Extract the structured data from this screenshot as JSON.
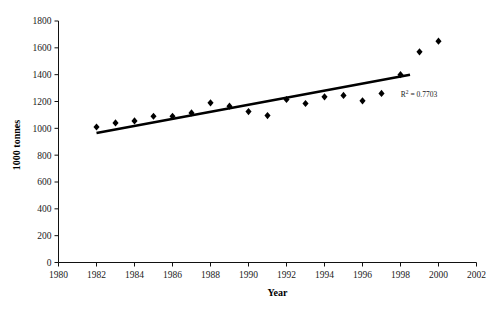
{
  "chart_data": {
    "type": "scatter",
    "title": "",
    "xlabel": "Year",
    "ylabel": "1000 tonnes",
    "xlim": [
      1980,
      2002
    ],
    "ylim": [
      0,
      1800
    ],
    "xticks": [
      1980,
      1982,
      1984,
      1986,
      1988,
      1990,
      1992,
      1994,
      1996,
      1998,
      2000,
      2002
    ],
    "yticks": [
      0,
      200,
      400,
      600,
      800,
      1000,
      1200,
      1400,
      1600,
      1800
    ],
    "xtick_labels": [
      "1980",
      "1982",
      "1984",
      "1986",
      "1988",
      "1990",
      "1992",
      "1994",
      "1996",
      "1998",
      "2000",
      "2002"
    ],
    "ytick_labels": [
      "0",
      "200",
      "400",
      "600",
      "800",
      "1000",
      "1200",
      "1400",
      "1600",
      "1800"
    ],
    "grid": false,
    "legend": false,
    "marker": "diamond",
    "marker_color": "#000000",
    "x": [
      1982,
      1983,
      1984,
      1985,
      1986,
      1987,
      1988,
      1989,
      1990,
      1991,
      1992,
      1993,
      1994,
      1995,
      1996,
      1997,
      1998,
      1999,
      2000
    ],
    "values": [
      1010,
      1040,
      1055,
      1090,
      1090,
      1115,
      1190,
      1165,
      1125,
      1095,
      1215,
      1185,
      1235,
      1245,
      1205,
      1260,
      1400,
      1570,
      1650
    ],
    "trendline": {
      "type": "linear",
      "x_start": 1982,
      "y_start": 965,
      "x_end": 1998.5,
      "y_end": 1400,
      "r_squared": 0.7703,
      "annotation": "= 0.7703",
      "annotation_prefix": "R",
      "annotation_sup": "2"
    }
  },
  "axes": {
    "x_axis_title": "Year",
    "y_axis_title": "1000 tonnes"
  }
}
